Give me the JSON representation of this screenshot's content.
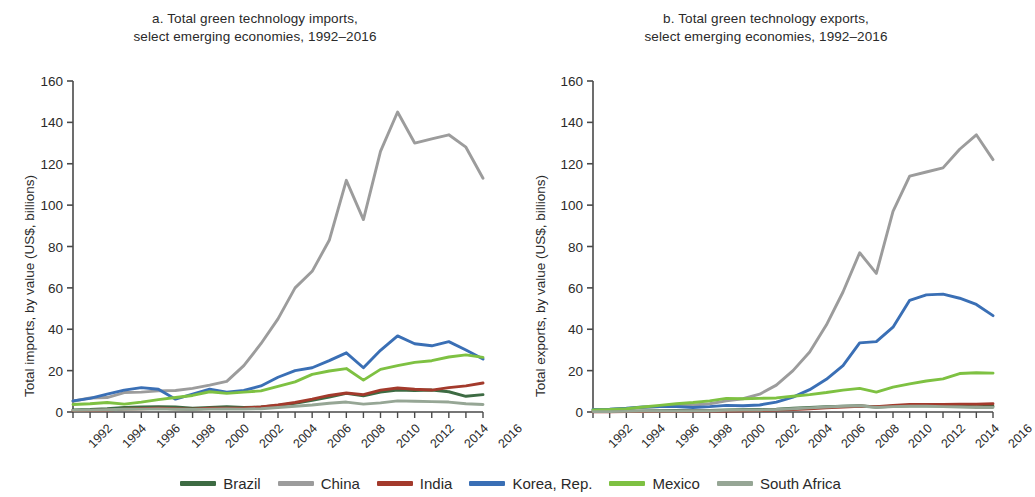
{
  "figure": {
    "panels": [
      {
        "id": "a",
        "title_line1": "a. Total green technology imports,",
        "title_line2": "select emerging economies, 1992–2016"
      },
      {
        "id": "b",
        "title_line1": "b. Total green technology exports,",
        "title_line2": "select emerging economies, 1992–2016"
      }
    ]
  },
  "legend": {
    "position": "bottom-center",
    "items": [
      {
        "label": "Brazil",
        "color": "#3d6b43"
      },
      {
        "label": "China",
        "color": "#9c9c9c"
      },
      {
        "label": "India",
        "color": "#a33a2c"
      },
      {
        "label": "Korea, Rep.",
        "color": "#3a6fb5"
      },
      {
        "label": "Mexico",
        "color": "#7ec142"
      },
      {
        "label": "South Africa",
        "color": "#96a695"
      }
    ]
  },
  "chart_data": [
    {
      "type": "line",
      "panel": "a",
      "title": "a. Total green technology imports, select emerging economies, 1992–2016",
      "xlabel": "",
      "ylabel": "Total imports, by value (US$, billions)",
      "xlim": [
        1992,
        2016
      ],
      "ylim": [
        0,
        160
      ],
      "yticks": [
        0,
        20,
        40,
        60,
        80,
        100,
        120,
        140,
        160
      ],
      "xticks": [
        1992,
        1994,
        1996,
        1998,
        2000,
        2002,
        2004,
        2006,
        2008,
        2010,
        2012,
        2014,
        2016
      ],
      "grid": false,
      "x": [
        1992,
        1993,
        1994,
        1995,
        1996,
        1997,
        1998,
        1999,
        2000,
        2001,
        2002,
        2003,
        2004,
        2005,
        2006,
        2007,
        2008,
        2009,
        2010,
        2011,
        2012,
        2013,
        2014,
        2015,
        2016
      ],
      "series": [
        {
          "name": "Brazil",
          "color": "#3d6b43",
          "values": [
            1.0,
            1.2,
            1.6,
            2.2,
            2.4,
            2.6,
            2.4,
            1.8,
            2.2,
            2.6,
            2.2,
            2.4,
            3.2,
            4.2,
            5.6,
            7.2,
            9.0,
            7.8,
            9.6,
            10.6,
            10.4,
            10.6,
            9.8,
            7.6,
            8.4
          ]
        },
        {
          "name": "China",
          "color": "#9c9c9c",
          "values": [
            5.2,
            6.8,
            7.0,
            9.4,
            9.6,
            10.2,
            10.4,
            11.4,
            13.0,
            14.8,
            22.4,
            33.0,
            45.0,
            60.0,
            68.0,
            83.0,
            112.0,
            93.0,
            126.0,
            145.0,
            130.0,
            132.0,
            134.0,
            128.0,
            113.0
          ]
        },
        {
          "name": "India",
          "color": "#a33a2c",
          "values": [
            0.7,
            0.8,
            1.0,
            1.4,
            1.6,
            1.8,
            1.6,
            1.4,
            1.8,
            1.8,
            2.0,
            2.4,
            3.4,
            4.6,
            6.2,
            8.0,
            9.2,
            8.4,
            10.6,
            11.6,
            11.0,
            10.6,
            11.8,
            12.6,
            14.0
          ]
        },
        {
          "name": "Korea, Rep.",
          "color": "#3a6fb5",
          "values": [
            5.4,
            6.6,
            8.6,
            10.6,
            11.8,
            11.0,
            6.2,
            8.6,
            11.0,
            9.6,
            10.4,
            12.6,
            16.8,
            20.0,
            21.4,
            24.8,
            28.6,
            21.4,
            29.8,
            36.8,
            33.0,
            32.0,
            34.0,
            30.0,
            25.6
          ]
        },
        {
          "name": "Mexico",
          "color": "#7ec142",
          "values": [
            3.6,
            4.0,
            4.6,
            3.8,
            4.8,
            6.0,
            7.0,
            8.0,
            9.8,
            9.0,
            9.6,
            10.2,
            12.4,
            14.6,
            18.2,
            19.8,
            21.0,
            15.4,
            20.6,
            22.4,
            24.0,
            24.8,
            26.6,
            27.6,
            26.4
          ]
        },
        {
          "name": "South Africa",
          "color": "#96a695",
          "values": [
            0.8,
            0.9,
            1.1,
            1.3,
            1.4,
            1.5,
            1.3,
            1.2,
            1.4,
            1.5,
            1.4,
            1.6,
            2.2,
            2.8,
            3.4,
            4.2,
            4.8,
            3.8,
            4.4,
            5.4,
            5.2,
            5.0,
            4.8,
            4.0,
            3.6
          ]
        }
      ]
    },
    {
      "type": "line",
      "panel": "b",
      "title": "b. Total green technology exports, select emerging economies, 1992–2016",
      "xlabel": "",
      "ylabel": "Total exports, by value (US$, billions)",
      "xlim": [
        1992,
        2016
      ],
      "ylim": [
        0,
        160
      ],
      "yticks": [
        0,
        20,
        40,
        60,
        80,
        100,
        120,
        140,
        160
      ],
      "xticks": [
        1992,
        1994,
        1996,
        1998,
        2000,
        2002,
        2004,
        2006,
        2008,
        2010,
        2012,
        2014,
        2016
      ],
      "grid": false,
      "x": [
        1992,
        1993,
        1994,
        1995,
        1996,
        1997,
        1998,
        1999,
        2000,
        2001,
        2002,
        2003,
        2004,
        2005,
        2006,
        2007,
        2008,
        2009,
        2010,
        2011,
        2012,
        2013,
        2014,
        2015,
        2016
      ],
      "series": [
        {
          "name": "Brazil",
          "color": "#3d6b43",
          "values": [
            0.3,
            0.3,
            0.4,
            0.5,
            0.6,
            0.7,
            0.7,
            0.8,
            1.0,
            1.1,
            1.2,
            1.4,
            1.8,
            2.2,
            2.6,
            2.8,
            3.0,
            2.4,
            2.8,
            3.0,
            3.0,
            3.0,
            2.8,
            2.6,
            2.8
          ]
        },
        {
          "name": "China",
          "color": "#9c9c9c",
          "values": [
            0.9,
            1.2,
            1.6,
            2.2,
            2.6,
            3.2,
            3.4,
            4.0,
            5.4,
            6.4,
            8.6,
            13.0,
            20.0,
            29.0,
            42.0,
            58.0,
            77.0,
            67.0,
            97.0,
            114.0,
            116.0,
            118.0,
            127.0,
            134.0,
            122.0
          ]
        },
        {
          "name": "India",
          "color": "#a33a2c",
          "values": [
            0.1,
            0.1,
            0.2,
            0.2,
            0.3,
            0.3,
            0.4,
            0.4,
            0.5,
            0.6,
            0.7,
            0.9,
            1.2,
            1.6,
            2.0,
            2.4,
            2.8,
            2.6,
            3.2,
            3.6,
            3.6,
            3.6,
            3.8,
            3.8,
            4.0
          ]
        },
        {
          "name": "Korea, Rep.",
          "color": "#3a6fb5",
          "values": [
            1.2,
            1.4,
            1.8,
            2.4,
            2.6,
            2.6,
            2.2,
            2.6,
            3.2,
            3.0,
            3.4,
            4.8,
            7.2,
            10.8,
            15.8,
            22.4,
            33.4,
            34.0,
            41.0,
            54.0,
            56.6,
            57.0,
            55.0,
            52.0,
            46.6
          ]
        },
        {
          "name": "Mexico",
          "color": "#7ec142",
          "values": [
            1.0,
            1.2,
            1.6,
            2.4,
            3.2,
            4.0,
            4.6,
            5.4,
            6.6,
            6.4,
            6.6,
            6.8,
            7.6,
            8.4,
            9.4,
            10.6,
            11.4,
            9.6,
            12.0,
            13.6,
            15.0,
            16.0,
            18.6,
            19.0,
            18.8
          ]
        },
        {
          "name": "South Africa",
          "color": "#96a695",
          "values": [
            0.2,
            0.2,
            0.3,
            0.4,
            0.5,
            0.5,
            0.6,
            0.6,
            0.8,
            0.9,
            1.0,
            1.2,
            1.6,
            2.0,
            2.4,
            2.8,
            3.0,
            2.2,
            2.6,
            2.8,
            2.8,
            2.6,
            2.4,
            2.2,
            2.2
          ]
        }
      ]
    }
  ]
}
